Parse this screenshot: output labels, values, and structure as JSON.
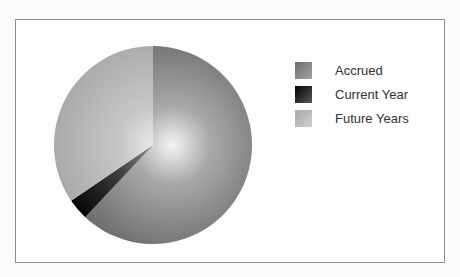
{
  "chart_data": {
    "type": "pie",
    "title": "",
    "categories": [
      "Accrued",
      "Current Year",
      "Future Years"
    ],
    "values": [
      62,
      3.5,
      34.5
    ],
    "unit": "%",
    "start_angle_deg": 0,
    "direction": "clockwise",
    "legend_position": "right",
    "colors": [
      "#7a7a7a",
      "#111111",
      "#b4b4b4"
    ]
  },
  "legend": {
    "items": [
      {
        "label": "Accrued",
        "color": "#7a7a7a"
      },
      {
        "label": "Current Year",
        "color": "#111111"
      },
      {
        "label": "Future Years",
        "color": "#b4b4b4"
      }
    ]
  }
}
